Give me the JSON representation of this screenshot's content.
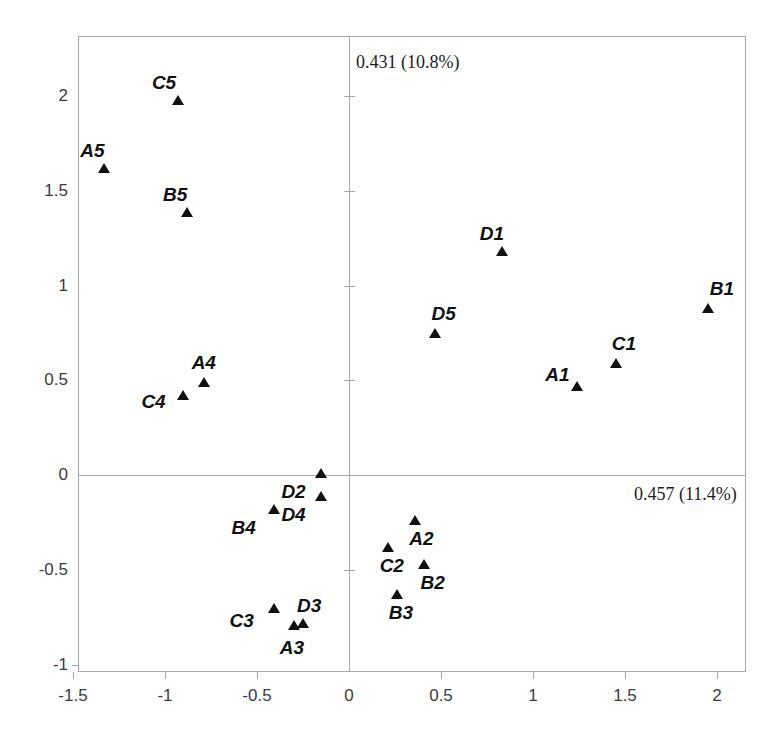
{
  "chart_data": {
    "type": "scatter",
    "title": "",
    "xlabel": "0.457 (11.4%)",
    "ylabel": "0.431 (10.8%)",
    "xlim": [
      -1.63,
      2.16
    ],
    "ylim": [
      -1.04,
      2.32
    ],
    "xticks": [
      "-1.5",
      "-1",
      "-0.5",
      "0",
      "0.5",
      "1",
      "1.5",
      "2"
    ],
    "xtickvalues": [
      -1.5,
      -1,
      -0.5,
      0,
      0.5,
      1,
      1.5,
      2
    ],
    "yticks": [
      "2",
      "1.5",
      "1",
      "0.5",
      "0",
      "-0.5",
      "-1"
    ],
    "ytickvalues": [
      2,
      1.5,
      1,
      0.5,
      0,
      -0.5,
      -1
    ],
    "grid": false,
    "legend": false,
    "marker_shape": "triangle-up",
    "marker_color": "#111111",
    "frame_color": "#a8a8a8",
    "points": [
      {
        "label": "C5",
        "x": -0.93,
        "y": 1.98,
        "label_dx": -26,
        "label_dy": -28
      },
      {
        "label": "A5",
        "x": -1.33,
        "y": 1.62,
        "label_dx": -24,
        "label_dy": -28
      },
      {
        "label": "B5",
        "x": -0.88,
        "y": 1.39,
        "label_dx": -24,
        "label_dy": -28
      },
      {
        "label": "D1",
        "x": 0.83,
        "y": 1.18,
        "label_dx": -22,
        "label_dy": -28
      },
      {
        "label": "B1",
        "x": 1.95,
        "y": 0.88,
        "label_dx": 2,
        "label_dy": -30
      },
      {
        "label": "D5",
        "x": 0.47,
        "y": 0.75,
        "label_dx": -4,
        "label_dy": -30
      },
      {
        "label": "C1",
        "x": 1.45,
        "y": 0.59,
        "label_dx": -4,
        "label_dy": -30
      },
      {
        "label": "A1",
        "x": 1.24,
        "y": 0.47,
        "label_dx": -32,
        "label_dy": -22
      },
      {
        "label": "A4",
        "x": -0.79,
        "y": 0.49,
        "label_dx": -12,
        "label_dy": -30
      },
      {
        "label": "C4",
        "x": -0.9,
        "y": 0.42,
        "label_dx": -42,
        "label_dy": -4
      },
      {
        "label": "D2",
        "x": -0.15,
        "y": 0.01,
        "label_dx": -40,
        "label_dy": 8
      },
      {
        "label": "D4",
        "x": -0.15,
        "y": -0.11,
        "label_dx": -40,
        "label_dy": 8
      },
      {
        "label": "B4",
        "x": -0.41,
        "y": -0.18,
        "label_dx": -42,
        "label_dy": 8
      },
      {
        "label": "A2",
        "x": 0.36,
        "y": -0.24,
        "label_dx": -6,
        "label_dy": 8
      },
      {
        "label": "C2",
        "x": 0.21,
        "y": -0.38,
        "label_dx": -8,
        "label_dy": 8
      },
      {
        "label": "B2",
        "x": 0.41,
        "y": -0.47,
        "label_dx": -4,
        "label_dy": 8
      },
      {
        "label": "B3",
        "x": 0.26,
        "y": -0.63,
        "label_dx": -8,
        "label_dy": 8
      },
      {
        "label": "C3",
        "x": -0.41,
        "y": -0.7,
        "label_dx": -44,
        "label_dy": 2
      },
      {
        "label": "D3",
        "x": -0.25,
        "y": -0.78,
        "label_dx": -6,
        "label_dy": -28
      },
      {
        "label": "A3",
        "x": -0.3,
        "y": -0.79,
        "label_dx": -14,
        "label_dy": 12
      }
    ]
  },
  "axis_captions": {
    "y_axis_caption": "0.431 (10.8%)",
    "x_axis_caption": "0.457 (11.4%)"
  }
}
